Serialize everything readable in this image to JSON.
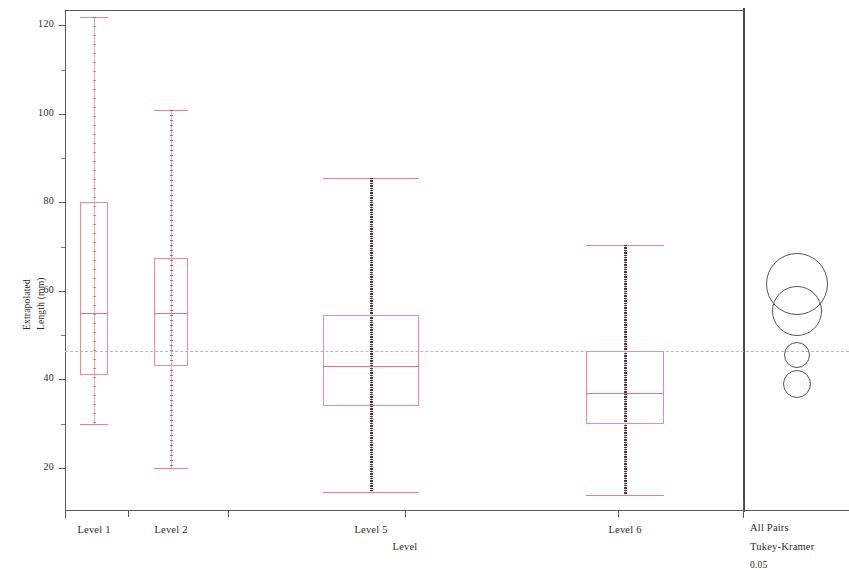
{
  "chart_data": {
    "type": "box",
    "title": "",
    "xlabel": "Level",
    "ylabel": "Extrapolated Length (mm)",
    "ylim": [
      10.5,
      123.5
    ],
    "yticks": [
      20,
      40,
      60,
      80,
      100,
      120
    ],
    "ytick_labels": [
      "20",
      "40",
      "60",
      "80",
      "100",
      "120"
    ],
    "minor_ticks": [
      30,
      50,
      70,
      90,
      110
    ],
    "grid": false,
    "grand_mean": 46.5,
    "grand_mean_style": "dashed",
    "categories": [
      "Level 1",
      "Level 2",
      "Level 5",
      "Level 6"
    ],
    "boxes": [
      {
        "label": "Level 1",
        "whisker_high": 122.0,
        "q3": 80.0,
        "median": 55.0,
        "q1": 41.0,
        "whisker_low": 30.0,
        "point_density": "sparse",
        "box_width_px": 28
      },
      {
        "label": "Level 2",
        "whisker_high": 101.0,
        "q3": 67.5,
        "median": 55.0,
        "q1": 43.0,
        "whisker_low": 20.0,
        "point_density": "medium",
        "box_width_px": 34
      },
      {
        "label": "Level 5",
        "whisker_high": 85.5,
        "q3": 54.5,
        "median": 43.0,
        "q1": 34.0,
        "whisker_low": 14.5,
        "point_density": "dense",
        "box_width_px": 96
      },
      {
        "label": "Level 6",
        "whisker_high": 70.5,
        "q3": 46.5,
        "median": 37.0,
        "q1": 30.0,
        "whisker_low": 14.0,
        "point_density": "dense",
        "box_width_px": 78
      }
    ],
    "comparison_circles": [
      {
        "center": 61.5,
        "radius_px": 31,
        "group": "Level 1"
      },
      {
        "center": 55.5,
        "radius_px": 25,
        "group": "Level 2"
      },
      {
        "center": 45.5,
        "radius_px": 13,
        "group": "Level 5"
      },
      {
        "center": 39.0,
        "radius_px": 14,
        "group": "Level 6"
      }
    ],
    "legend": {
      "line1": "All Pairs",
      "line2": "Tukey-Kramer",
      "line3": "0.05"
    },
    "colors": {
      "box_outline": "#f08a9e",
      "median": "#ef6d87",
      "whisker": "#f3a8b8",
      "points": "#3c3c3c",
      "axis": "#5a5a5a",
      "grand_mean": "#b9b9c4",
      "circle": "#565656"
    }
  }
}
